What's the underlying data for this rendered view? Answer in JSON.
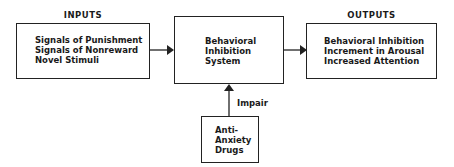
{
  "diagram": {
    "inputs_heading": "INPUTS",
    "outputs_heading": "OUTPUTS",
    "inputs": [
      "Signals of Punishment",
      "Signals of Nonreward",
      "Novel Stimuli"
    ],
    "system": [
      "Behavioral",
      "Inhibition",
      "System"
    ],
    "outputs": [
      "Behavioral Inhibition",
      "Increment in Arousal",
      "Increased Attention"
    ],
    "drug": [
      "Anti-",
      "Anxiety",
      "Drugs"
    ],
    "drug_edge_label": "Impair"
  }
}
